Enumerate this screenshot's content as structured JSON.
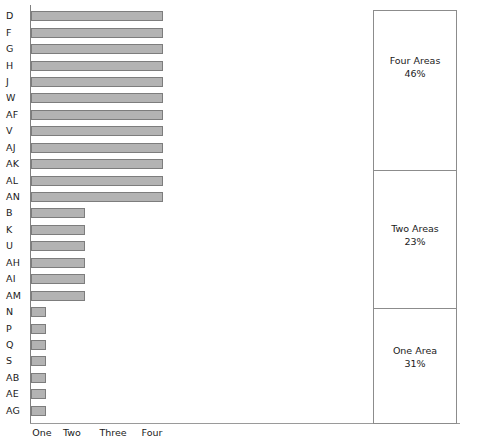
{
  "chart_data": {
    "type": "bar",
    "orientation": "horizontal",
    "title": "",
    "xlabel": "",
    "ylabel": "",
    "grid": false,
    "xticks": [
      "One",
      "Two",
      "Three",
      "Four"
    ],
    "xtick_values": [
      1,
      2,
      3,
      4
    ],
    "xlim": [
      0,
      4.35
    ],
    "categories": [
      "D",
      "F",
      "G",
      "H",
      "J",
      "W",
      "AF",
      "V",
      "AJ",
      "AK",
      "AL",
      "AN",
      "B",
      "K",
      "U",
      "AH",
      "AI",
      "AM",
      "N",
      "P",
      "Q",
      "S",
      "AB",
      "AE",
      "AG"
    ],
    "values": [
      4,
      4,
      4,
      4,
      4,
      4,
      4,
      4,
      4,
      4,
      4,
      4,
      2,
      2,
      2,
      2,
      2,
      2,
      1,
      1,
      1,
      1,
      1,
      1,
      1
    ],
    "bar_color": "#b3b3b3",
    "bar_edge_color": "#7d7d7d",
    "axis_color": "#8c8c8c"
  },
  "legend": {
    "sections": [
      {
        "title": "Four Areas",
        "value": "46%"
      },
      {
        "title": "Two Areas",
        "value": "23%"
      },
      {
        "title": "One Area",
        "value": "31%"
      }
    ]
  }
}
